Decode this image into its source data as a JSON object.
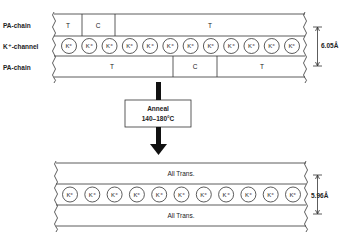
{
  "before": {
    "row_labels": {
      "top": "PA-chain",
      "middle": "K⁺-channel",
      "bottom": "PA-chain"
    },
    "top_chain_segments": [
      "T",
      "C",
      "T"
    ],
    "bottom_chain_segments": [
      "T",
      "C",
      "T"
    ],
    "ion_label": "K⁺",
    "ion_count": 12,
    "spacing": "6.05Å"
  },
  "process": {
    "line1": "Anneal",
    "line2": "140–180°C"
  },
  "after": {
    "top_chain_label": "All Trans.",
    "bottom_chain_label": "All Trans.",
    "ion_label": "K⁺",
    "ion_count": 11,
    "spacing": "5.96Å"
  }
}
